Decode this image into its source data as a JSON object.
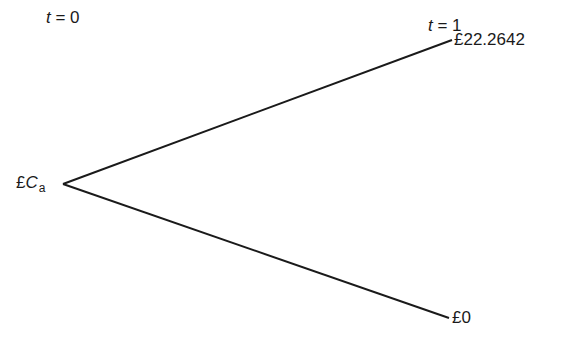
{
  "time_labels": {
    "t0": {
      "var": "t",
      "eq": " = 0"
    },
    "t1": {
      "var": "t",
      "eq": " = 1"
    }
  },
  "nodes": {
    "root": {
      "currency": "£",
      "var": "C",
      "subscript": "a"
    },
    "up": {
      "label": "£22.2642"
    },
    "down": {
      "label": "£0"
    }
  },
  "colors": {
    "line": "#1a1a1a",
    "background": "#ffffff"
  }
}
